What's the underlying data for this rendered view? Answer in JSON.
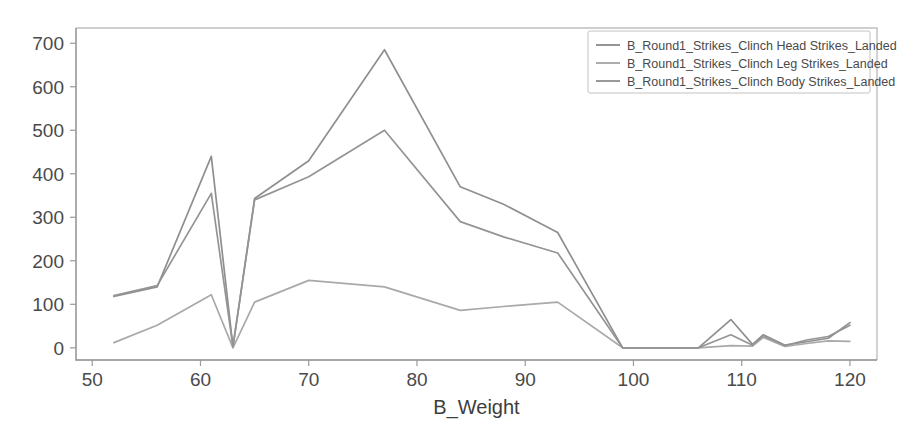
{
  "chart_data": {
    "type": "line",
    "title": "",
    "xlabel": "B_Weight",
    "ylabel": "",
    "xlim": [
      48.5,
      122.5
    ],
    "ylim": [
      -28,
      735
    ],
    "xticks": [
      50,
      60,
      70,
      80,
      90,
      100,
      110,
      120
    ],
    "yticks": [
      0,
      100,
      200,
      300,
      400,
      500,
      600,
      700
    ],
    "grid": false,
    "legend_position": "upper right",
    "series": [
      {
        "name": "B_Round1_Strikes_Clinch Head Strikes_Landed",
        "color": "#8f8f8f",
        "x": [
          52,
          56,
          61,
          63,
          65,
          70,
          77,
          84,
          88,
          93,
          99,
          103,
          106,
          109,
          111,
          112,
          114,
          116,
          118,
          120
        ],
        "values": [
          118,
          140,
          440,
          3,
          343,
          430,
          685,
          370,
          330,
          265,
          0,
          0,
          0,
          65,
          8,
          30,
          6,
          14,
          22,
          58
        ]
      },
      {
        "name": "B_Round1_Strikes_Clinch Leg Strikes_Landed",
        "color": "#a9a9a9",
        "x": [
          52,
          56,
          61,
          63,
          65,
          70,
          77,
          84,
          88,
          93,
          99,
          103,
          106,
          109,
          111,
          112,
          114,
          116,
          118,
          120
        ],
        "values": [
          12,
          52,
          122,
          0,
          105,
          155,
          140,
          86,
          95,
          105,
          0,
          0,
          0,
          5,
          4,
          24,
          3,
          10,
          16,
          15
        ]
      },
      {
        "name": "B_Round1_Strikes_Clinch Body Strikes_Landed",
        "color": "#949494",
        "x": [
          52,
          56,
          61,
          63,
          65,
          70,
          77,
          84,
          88,
          93,
          99,
          103,
          106,
          109,
          111,
          112,
          114,
          116,
          118,
          120
        ],
        "values": [
          120,
          143,
          355,
          2,
          340,
          393,
          500,
          290,
          255,
          218,
          0,
          0,
          0,
          30,
          6,
          28,
          5,
          18,
          26,
          52
        ]
      }
    ]
  },
  "axes": {
    "x_tick_labels": [
      "50",
      "60",
      "70",
      "80",
      "90",
      "100",
      "110",
      "120"
    ],
    "y_tick_labels": [
      "0",
      "100",
      "200",
      "300",
      "400",
      "500",
      "600",
      "700"
    ],
    "x_axis_title": "B_Weight"
  },
  "legend": {
    "entries": [
      {
        "label": "B_Round1_Strikes_Clinch Head Strikes_Landed"
      },
      {
        "label": "B_Round1_Strikes_Clinch Leg Strikes_Landed"
      },
      {
        "label": "B_Round1_Strikes_Clinch Body Strikes_Landed"
      }
    ]
  }
}
